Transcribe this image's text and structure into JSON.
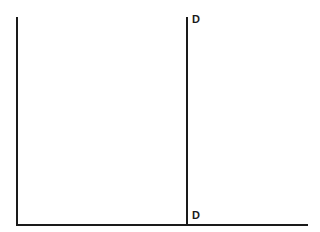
{
  "diagram": {
    "type": "supply-demand-axes",
    "axes": {
      "y_axis": {
        "x": 17,
        "y_top": 17,
        "y_bottom": 225
      },
      "x_axis": {
        "y": 225,
        "x_left": 17,
        "x_right": 307
      }
    },
    "curves": [
      {
        "name": "D",
        "orientation": "vertical",
        "x": 187,
        "y_top": 17,
        "y_bottom": 225,
        "label_top": "D",
        "label_bottom": "D"
      }
    ],
    "colors": {
      "line": "#1a1a1a",
      "background": "#ffffff"
    }
  }
}
